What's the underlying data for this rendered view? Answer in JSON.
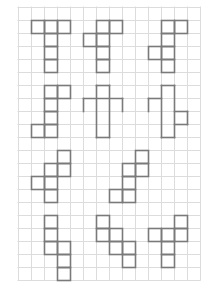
{
  "grid": {
    "origin_x": 18,
    "origin_y": 7,
    "cell": 13,
    "cols": 14,
    "rows": 21,
    "line_color": "#dcdcdc",
    "figure_color": "#7a7a7a"
  },
  "figures": [
    {
      "id": "fig-1",
      "cells": [
        [
          1,
          1
        ],
        [
          2,
          1
        ],
        [
          3,
          1
        ],
        [
          2,
          2
        ],
        [
          2,
          3
        ],
        [
          2,
          4
        ]
      ]
    },
    {
      "id": "fig-2",
      "cells": [
        [
          6,
          1
        ],
        [
          7,
          1
        ],
        [
          5,
          2
        ],
        [
          6,
          2
        ],
        [
          6,
          3
        ],
        [
          6,
          4
        ]
      ]
    },
    {
      "id": "fig-3",
      "cells": [
        [
          11,
          1
        ],
        [
          12,
          1
        ],
        [
          11,
          2
        ],
        [
          10,
          3
        ],
        [
          11,
          3
        ],
        [
          11,
          4
        ]
      ]
    },
    {
      "id": "fig-4",
      "cells": [
        [
          2,
          6
        ],
        [
          3,
          6
        ],
        [
          2,
          7
        ],
        [
          2,
          8
        ],
        [
          1,
          9
        ],
        [
          2,
          9
        ]
      ]
    },
    {
      "id": "fig-5",
      "segments": [
        [
          6,
          6,
          7,
          6
        ],
        [
          6,
          6,
          6,
          10
        ],
        [
          7,
          6,
          7,
          10
        ],
        [
          6,
          10,
          7,
          10
        ],
        [
          5,
          7,
          8,
          7
        ],
        [
          5,
          7,
          5,
          8
        ],
        [
          8,
          7,
          8,
          8
        ]
      ]
    },
    {
      "id": "fig-6",
      "segments": [
        [
          11,
          6,
          12,
          6
        ],
        [
          11,
          6,
          11,
          10
        ],
        [
          12,
          6,
          12,
          10
        ],
        [
          11,
          10,
          12,
          10
        ],
        [
          10,
          7,
          11,
          7
        ],
        [
          10,
          7,
          10,
          8
        ],
        [
          12,
          8,
          13,
          8
        ],
        [
          13,
          8,
          13,
          9
        ],
        [
          12,
          9,
          13,
          9
        ]
      ]
    },
    {
      "id": "fig-7",
      "cells": [
        [
          3,
          11
        ],
        [
          2,
          12
        ],
        [
          3,
          12
        ],
        [
          1,
          13
        ],
        [
          2,
          13
        ],
        [
          2,
          14
        ]
      ]
    },
    {
      "id": "fig-8",
      "cells": [
        [
          9,
          11
        ],
        [
          8,
          12
        ],
        [
          9,
          12
        ],
        [
          8,
          13
        ],
        [
          7,
          14
        ],
        [
          8,
          14
        ]
      ]
    },
    {
      "id": "fig-9",
      "cells": [
        [
          2,
          16
        ],
        [
          2,
          17
        ],
        [
          2,
          18
        ],
        [
          3,
          18
        ],
        [
          3,
          19
        ],
        [
          3,
          20
        ]
      ]
    },
    {
      "id": "fig-10",
      "cells": [
        [
          6,
          16
        ],
        [
          6,
          17
        ],
        [
          7,
          17
        ],
        [
          7,
          18
        ],
        [
          8,
          18
        ],
        [
          8,
          19
        ]
      ]
    },
    {
      "id": "fig-11",
      "cells": [
        [
          12,
          16
        ],
        [
          10,
          17
        ],
        [
          11,
          17
        ],
        [
          12,
          17
        ],
        [
          11,
          18
        ],
        [
          11,
          19
        ]
      ]
    }
  ]
}
